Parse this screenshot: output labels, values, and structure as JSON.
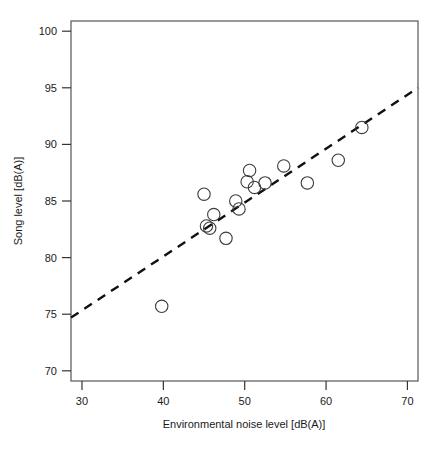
{
  "chart_data": {
    "type": "scatter",
    "title": "",
    "subtitle": "",
    "xlabel": "Environmental noise level [dB(A)]",
    "ylabel": "Song level [dB(A)]",
    "xlim": [
      28.65,
      71.3
    ],
    "ylim": [
      69.1,
      100.9
    ],
    "xticks": [
      30,
      40,
      50,
      60,
      70
    ],
    "xticklabels": [
      "30",
      "40",
      "50",
      "60",
      "70"
    ],
    "yticks": [
      70,
      75,
      80,
      85,
      90,
      95,
      100
    ],
    "yticklabels": [
      "70",
      "75",
      "80",
      "85",
      "90",
      "95",
      "100"
    ],
    "grid": false,
    "legend": null,
    "legend_position": "none",
    "marker": {
      "shape": "open-circle",
      "radius": 6.2,
      "edge_color": "#3c3c3c",
      "fill": "none",
      "edge_width": 1.1
    },
    "points": [
      {
        "x": 39.8,
        "y": 75.7
      },
      {
        "x": 45.0,
        "y": 85.6
      },
      {
        "x": 45.3,
        "y": 82.8
      },
      {
        "x": 45.7,
        "y": 82.6
      },
      {
        "x": 46.2,
        "y": 83.8
      },
      {
        "x": 47.7,
        "y": 81.7
      },
      {
        "x": 48.9,
        "y": 85.0
      },
      {
        "x": 49.3,
        "y": 84.3
      },
      {
        "x": 50.3,
        "y": 86.7
      },
      {
        "x": 50.6,
        "y": 87.7
      },
      {
        "x": 51.2,
        "y": 86.2
      },
      {
        "x": 52.5,
        "y": 86.6
      },
      {
        "x": 54.8,
        "y": 88.1
      },
      {
        "x": 57.7,
        "y": 86.6
      },
      {
        "x": 61.5,
        "y": 88.6
      },
      {
        "x": 64.4,
        "y": 91.5
      }
    ],
    "series": [
      {
        "name": "Song level measurements",
        "type": "scatter",
        "x": [
          39.8,
          45.0,
          45.3,
          45.7,
          46.2,
          47.7,
          48.9,
          49.3,
          50.3,
          50.6,
          51.2,
          52.5,
          54.8,
          57.7,
          61.5,
          64.4
        ],
        "values": [
          75.7,
          85.6,
          82.8,
          82.6,
          83.8,
          81.7,
          85.0,
          84.3,
          86.7,
          87.7,
          86.2,
          86.6,
          88.1,
          86.6,
          88.6,
          91.5
        ]
      },
      {
        "name": "Regression line",
        "type": "line",
        "style": "dashed",
        "color": "#111111",
        "width": 2.4,
        "x": [
          28.65,
          71.3
        ],
        "values": [
          74.7,
          95.0
        ]
      }
    ],
    "annotations": []
  },
  "axes": {
    "frame_color": "#555555",
    "frame_width": 1.2,
    "tick_color": "#333333"
  }
}
